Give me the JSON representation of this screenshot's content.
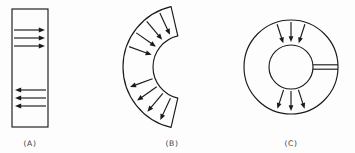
{
  "figure": {
    "background_color": "#fdfdfd",
    "line_color": "#1a1a1a",
    "caption_color": "#3a3a3a",
    "panels": [
      {
        "id": "panel-a",
        "caption": "(A)",
        "shape": "rectangle",
        "description": "Straight bar with uniform horizontal flux arrows",
        "caption_x": 30,
        "caption_y": 146,
        "rect": {
          "x": 12,
          "y": 9,
          "width": 36,
          "height": 118
        },
        "arrow_groups": [
          {
            "name": "upper-arrows",
            "direction": "right",
            "arrows": [
              {
                "x1": 14,
                "y1": 30,
                "x2": 45,
                "y2": 30
              },
              {
                "x1": 14,
                "y1": 38,
                "x2": 45,
                "y2": 38
              },
              {
                "x1": 14,
                "y1": 46,
                "x2": 45,
                "y2": 46
              }
            ]
          },
          {
            "name": "lower-arrows",
            "direction": "left",
            "arrows": [
              {
                "x1": 46,
                "y1": 90,
                "x2": 15,
                "y2": 90
              },
              {
                "x1": 46,
                "y1": 98,
                "x2": 15,
                "y2": 98
              },
              {
                "x1": 46,
                "y1": 106,
                "x2": 15,
                "y2": 106
              }
            ]
          }
        ]
      },
      {
        "id": "panel-b",
        "caption": "(B)",
        "shape": "annular-sector",
        "description": "C-shaped curved bar opening to the right with radial flux arrows",
        "caption_x": 172,
        "caption_y": 146,
        "center_x": 185,
        "center_y": 67,
        "outer_radius": 62,
        "inner_radius": 32,
        "start_angle_deg": 103,
        "end_angle_deg": 257,
        "arrow_groups": [
          {
            "name": "upper-arrows",
            "direction": "inward",
            "angles_deg": [
              115,
              130,
              145,
              160
            ]
          },
          {
            "name": "lower-arrows",
            "direction": "outward",
            "angles_deg": [
              200,
              215,
              230,
              245
            ]
          }
        ]
      },
      {
        "id": "panel-c",
        "caption": "(C)",
        "shape": "annulus-with-slit",
        "description": "Closed ring with a narrow radial air gap on the right and radial flux arrows",
        "caption_x": 291,
        "caption_y": 146,
        "center_x": 291,
        "center_y": 67,
        "outer_radius": 47,
        "inner_radius": 22,
        "gap_half_width": 2.2,
        "gap_angle_deg": 0,
        "arrow_groups": [
          {
            "name": "upper-arrows",
            "direction": "inward",
            "angles_deg": [
              108,
              90,
              72
            ]
          },
          {
            "name": "lower-arrows",
            "direction": "outward",
            "angles_deg": [
              252,
              270,
              288
            ]
          }
        ]
      }
    ]
  }
}
